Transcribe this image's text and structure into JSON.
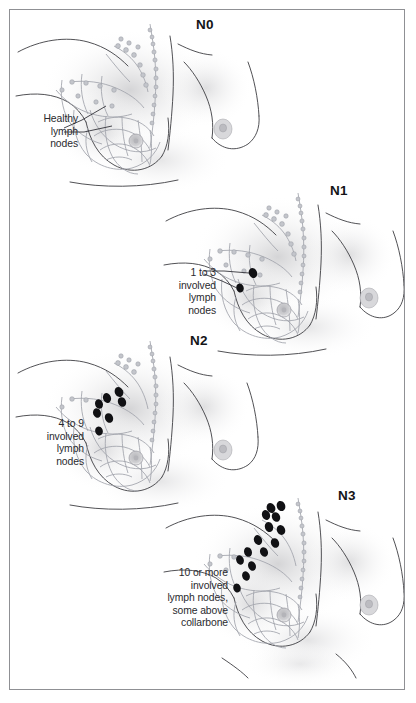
{
  "figure": {
    "border_color": "#8f9094",
    "background": "#ffffff",
    "width": 416,
    "height": 703
  },
  "palette": {
    "skin_shade": "#dcdcdd",
    "outline": "#3d3d42",
    "lymph_network": "#a0a3ab",
    "involved_node": "#111114",
    "text": "#2a2a2e",
    "label": "#141417"
  },
  "panels": [
    {
      "id": "n0",
      "stage_label": "N0",
      "stage_label_x": 196,
      "stage_label_y": 17,
      "caption": "Healthy\nlymph\nnodes",
      "caption_align": "right",
      "caption_x": 18,
      "caption_y": 113,
      "involved_node_count": 0,
      "involved_nodes": [],
      "panel_x": 10,
      "panel_y": 10
    },
    {
      "id": "n1",
      "stage_label": "N1",
      "stage_label_x": 330,
      "stage_label_y": 183,
      "caption": "1 to 3\ninvolved\nlymph\nnodes",
      "caption_align": "right",
      "caption_x": 160,
      "caption_y": 267,
      "involved_node_count": 2,
      "involved_nodes": [
        {
          "x": 253,
          "y": 273
        },
        {
          "x": 240,
          "y": 288
        }
      ],
      "panel_x": 160,
      "panel_y": 175
    },
    {
      "id": "n2",
      "stage_label": "N2",
      "stage_label_x": 190,
      "stage_label_y": 333,
      "caption": "4 to 9\ninvolved\nlymph\nnodes",
      "caption_align": "right",
      "caption_x": 28,
      "caption_y": 418,
      "involved_node_count": 7,
      "involved_nodes": [
        {
          "x": 119,
          "y": 392
        },
        {
          "x": 107,
          "y": 398
        },
        {
          "x": 99,
          "y": 404
        },
        {
          "x": 122,
          "y": 402
        },
        {
          "x": 97,
          "y": 408
        },
        {
          "x": 109,
          "y": 418
        },
        {
          "x": 99,
          "y": 431
        }
      ],
      "panel_x": 10,
      "panel_y": 325
    },
    {
      "id": "n3",
      "stage_label": "N3",
      "stage_label_x": 338,
      "stage_label_y": 488,
      "caption": "10 or more\ninvolved\nlymph nodes,\nsome above\ncollarbone",
      "caption_align": "right",
      "caption_x": 150,
      "caption_y": 567,
      "involved_node_count": 14,
      "involved_nodes": [
        {
          "x": 271,
          "y": 508
        },
        {
          "x": 281,
          "y": 506
        },
        {
          "x": 266,
          "y": 515
        },
        {
          "x": 276,
          "y": 517
        },
        {
          "x": 269,
          "y": 527
        },
        {
          "x": 281,
          "y": 530
        },
        {
          "x": 258,
          "y": 540
        },
        {
          "x": 275,
          "y": 543
        },
        {
          "x": 248,
          "y": 552
        },
        {
          "x": 264,
          "y": 552
        },
        {
          "x": 240,
          "y": 560
        },
        {
          "x": 252,
          "y": 566
        },
        {
          "x": 246,
          "y": 576
        },
        {
          "x": 237,
          "y": 588
        }
      ],
      "panel_x": 160,
      "panel_y": 478
    }
  ]
}
